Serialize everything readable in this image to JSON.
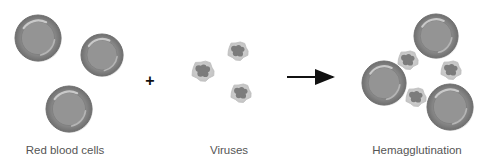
{
  "diagram": {
    "title": "Hemagglutination",
    "colors": {
      "rbc_fill": "#8a8a8a",
      "rbc_rim": "#6e6e6e",
      "rbc_center": "#949494",
      "rbc_highlight": "#c9c9c9",
      "virus_envelope": "#cfcfcf",
      "virus_core": "#7c7c7c",
      "arrow": "#111111",
      "label": "#555555"
    },
    "groups": [
      {
        "label": "Red blood cells",
        "label_x": 65,
        "rbcs": [
          {
            "cx": 38,
            "cy": 38,
            "r": 23
          },
          {
            "cx": 102,
            "cy": 55,
            "r": 21
          },
          {
            "cx": 69,
            "cy": 109,
            "r": 23
          }
        ]
      },
      {
        "label": "Viruses",
        "label_x": 229,
        "viruses": [
          {
            "cx": 238,
            "cy": 51,
            "r": 11
          },
          {
            "cx": 203,
            "cy": 71,
            "r": 12
          },
          {
            "cx": 241,
            "cy": 93,
            "r": 11
          }
        ]
      },
      {
        "label": "Hemagglutination",
        "label_x": 417,
        "rbcs": [
          {
            "cx": 436,
            "cy": 36,
            "r": 22
          },
          {
            "cx": 384,
            "cy": 83,
            "r": 22
          },
          {
            "cx": 450,
            "cy": 107,
            "r": 23
          }
        ],
        "viruses": [
          {
            "cx": 408,
            "cy": 60,
            "r": 11
          },
          {
            "cx": 451,
            "cy": 70,
            "r": 11
          },
          {
            "cx": 416,
            "cy": 97,
            "r": 11
          }
        ]
      }
    ],
    "operators": {
      "plus": {
        "symbol": "+",
        "x": 150,
        "y": 81
      },
      "arrow": {
        "x1": 287,
        "x2": 337,
        "y": 77
      }
    }
  }
}
